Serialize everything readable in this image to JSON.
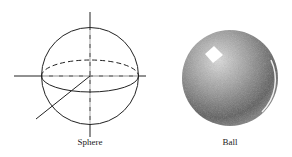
{
  "figures": [
    {
      "name": "sphere",
      "label": "Sphere"
    },
    {
      "name": "ball",
      "label": "Ball"
    }
  ],
  "colors": {
    "line": "#222222",
    "ball_dark": "#555555",
    "ball_light": "#d8d8d8",
    "highlight": "#ffffff"
  }
}
